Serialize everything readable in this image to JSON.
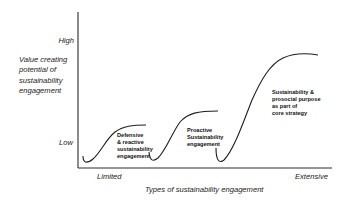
{
  "diagram": {
    "type": "s-curve-progression",
    "y_axis": {
      "title_lines": [
        "Value creating",
        "potential of",
        "sustainability",
        "engagement"
      ],
      "high_label": "High",
      "low_label": "Low"
    },
    "x_axis": {
      "title": "Types of sustainability engagement",
      "min_label": "Limited",
      "max_label": "Extensive"
    },
    "stages": [
      {
        "id": "defensive",
        "lines": [
          "Defensive",
          "& reactive",
          "sustainability",
          "engagement"
        ]
      },
      {
        "id": "proactive",
        "lines": [
          "Proactive",
          "Sustainability",
          "engagement"
        ]
      },
      {
        "id": "core-strategy",
        "lines": [
          "Sustainability &",
          "prosocial purpose",
          "as part of",
          "core strategy"
        ]
      }
    ],
    "colors": {
      "line": "#1e1e1e",
      "text": "#1a1a1a",
      "background": "#ffffff"
    }
  }
}
